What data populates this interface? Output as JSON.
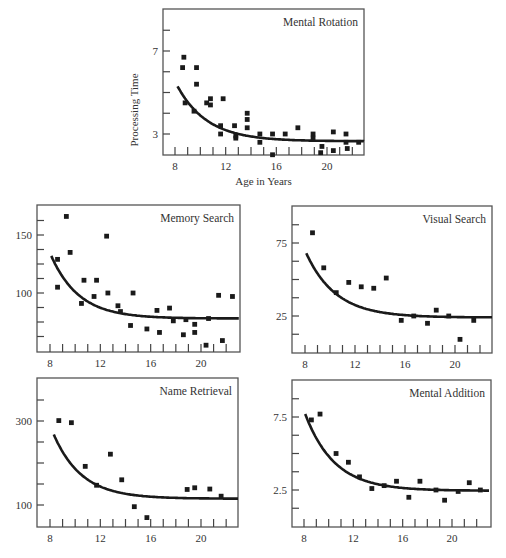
{
  "figure": {
    "x_axis_label": "Age in Years",
    "y_axis_label": "Processing Time"
  },
  "chart_data": [
    {
      "type": "scatter",
      "title": "Mental Rotation",
      "xlabel": "Age in Years",
      "ylabel": "Processing Time",
      "xlim": [
        7,
        23
      ],
      "ylim": [
        2,
        9
      ],
      "x_ticks": [
        8,
        12,
        16,
        20
      ],
      "y_ticks_labeled": [
        3,
        7
      ],
      "grid": false,
      "frame": {
        "x0": 163,
        "y0": 9,
        "x1": 364,
        "y1": 155
      },
      "axis_map": {
        "x_ref": [
          8,
          175,
          20,
          327
        ],
        "y_ref": [
          3,
          134,
          7,
          51
        ]
      },
      "points": [
        [
          8.7,
          6.7
        ],
        [
          8.6,
          6.2
        ],
        [
          9.7,
          6.2
        ],
        [
          9.7,
          5.4
        ],
        [
          8.8,
          4.5
        ],
        [
          9.5,
          4.1
        ],
        [
          10.5,
          4.5
        ],
        [
          10.8,
          4.7
        ],
        [
          10.8,
          4.4
        ],
        [
          11.8,
          4.7
        ],
        [
          11.6,
          3.4
        ],
        [
          11.6,
          3.0
        ],
        [
          12.7,
          3.4
        ],
        [
          12.8,
          2.9
        ],
        [
          12.8,
          2.8
        ],
        [
          13.7,
          4.0
        ],
        [
          13.7,
          3.7
        ],
        [
          13.7,
          3.3
        ],
        [
          14.7,
          3.0
        ],
        [
          14.7,
          2.6
        ],
        [
          15.7,
          3.0
        ],
        [
          15.7,
          2.0
        ],
        [
          16.7,
          3.0
        ],
        [
          17.7,
          3.3
        ],
        [
          18.9,
          3.0
        ],
        [
          18.9,
          2.8
        ],
        [
          19.6,
          2.4
        ],
        [
          19.5,
          2.1
        ],
        [
          20.5,
          3.1
        ],
        [
          20.5,
          2.2
        ],
        [
          21.5,
          3.0
        ],
        [
          21.5,
          2.6
        ],
        [
          21.6,
          2.3
        ],
        [
          22.5,
          2.6
        ]
      ],
      "curve": {
        "form": "exponential_decay",
        "asymptote": 2.65,
        "start": [
          8.2,
          5.3
        ],
        "k": 0.42,
        "x_range": [
          8.2,
          23
        ]
      }
    },
    {
      "type": "scatter",
      "title": "Memory Search",
      "xlabel": "",
      "ylabel": "",
      "xlim": [
        7,
        23
      ],
      "ylim": [
        50,
        175
      ],
      "x_ticks": [
        8,
        12,
        16,
        20
      ],
      "y_ticks_labeled": [
        100,
        150
      ],
      "grid": false,
      "frame": {
        "x0": 37,
        "y0": 205,
        "x1": 240,
        "y1": 352
      },
      "axis_map": {
        "x_ref": [
          8,
          50,
          20,
          201
        ],
        "y_ref": [
          100,
          293,
          150,
          235
        ]
      },
      "points": [
        [
          9.3,
          166
        ],
        [
          8.6,
          129
        ],
        [
          8.6,
          105
        ],
        [
          9.6,
          135
        ],
        [
          10.5,
          91
        ],
        [
          10.7,
          111
        ],
        [
          11.5,
          97
        ],
        [
          11.7,
          111
        ],
        [
          12.5,
          149
        ],
        [
          12.6,
          100
        ],
        [
          13.4,
          89
        ],
        [
          13.6,
          84
        ],
        [
          14.4,
          72
        ],
        [
          14.6,
          100
        ],
        [
          15.7,
          69
        ],
        [
          16.5,
          85
        ],
        [
          16.7,
          66
        ],
        [
          17.5,
          87
        ],
        [
          17.8,
          76
        ],
        [
          18.6,
          64
        ],
        [
          18.8,
          77
        ],
        [
          19.5,
          73
        ],
        [
          19.5,
          66
        ],
        [
          20.4,
          55
        ],
        [
          20.6,
          78
        ],
        [
          21.4,
          98
        ],
        [
          21.7,
          59
        ],
        [
          22.5,
          97
        ]
      ],
      "curve": {
        "form": "exponential_decay",
        "asymptote": 78,
        "start": [
          8.1,
          132
        ],
        "k": 0.45,
        "x_range": [
          8.1,
          23
        ]
      }
    },
    {
      "type": "scatter",
      "title": "Visual Search",
      "xlabel": "",
      "ylabel": "",
      "xlim": [
        7,
        23
      ],
      "ylim": [
        0,
        90
      ],
      "x_ticks": [
        8,
        12,
        16,
        20
      ],
      "y_ticks_labeled": [
        25,
        75
      ],
      "grid": false,
      "frame": {
        "x0": 292,
        "y0": 206,
        "x1": 492,
        "y1": 353
      },
      "axis_map": {
        "x_ref": [
          8,
          305,
          20,
          455
        ],
        "y_ref": [
          25,
          316,
          75,
          243
        ]
      },
      "points": [
        [
          8.6,
          82
        ],
        [
          9.5,
          58
        ],
        [
          10.5,
          41
        ],
        [
          11.5,
          48
        ],
        [
          12.5,
          45
        ],
        [
          13.5,
          44
        ],
        [
          14.5,
          51
        ],
        [
          15.7,
          22
        ],
        [
          16.7,
          25
        ],
        [
          17.8,
          20
        ],
        [
          18.5,
          29
        ],
        [
          19.5,
          25
        ],
        [
          20.4,
          9
        ],
        [
          21.5,
          22
        ]
      ],
      "curve": {
        "form": "exponential_decay",
        "asymptote": 24,
        "start": [
          8.1,
          68
        ],
        "k": 0.42,
        "x_range": [
          8.1,
          23
        ]
      }
    },
    {
      "type": "scatter",
      "title": "Name Retrieval",
      "xlabel": "",
      "ylabel": "",
      "xlim": [
        7,
        23
      ],
      "ylim": [
        50,
        400
      ],
      "x_ticks": [
        8,
        12,
        16,
        20
      ],
      "y_ticks_labeled": [
        100,
        300
      ],
      "grid": false,
      "frame": {
        "x0": 37,
        "y0": 378,
        "x1": 238,
        "y1": 527
      },
      "axis_map": {
        "x_ref": [
          8,
          50,
          20,
          201
        ],
        "y_ref": [
          100,
          505,
          300,
          421
        ]
      },
      "points": [
        [
          8.7,
          301
        ],
        [
          9.7,
          296
        ],
        [
          10.8,
          192
        ],
        [
          11.7,
          147
        ],
        [
          12.8,
          221
        ],
        [
          13.7,
          160
        ],
        [
          14.7,
          96
        ],
        [
          15.7,
          70
        ],
        [
          18.9,
          137
        ],
        [
          19.5,
          141
        ],
        [
          20.7,
          138
        ],
        [
          21.6,
          121
        ]
      ],
      "curve": {
        "form": "exponential_decay",
        "asymptote": 115,
        "start": [
          8.3,
          268
        ],
        "k": 0.45,
        "x_range": [
          8.3,
          23
        ]
      }
    },
    {
      "type": "scatter",
      "title": "Mental Addition",
      "xlabel": "",
      "ylabel": "",
      "xlim": [
        7,
        23
      ],
      "ylim": [
        0,
        10
      ],
      "x_ticks": [
        8,
        12,
        16,
        20
      ],
      "y_ticks_labeled": [
        2.5,
        7.5
      ],
      "grid": false,
      "frame": {
        "x0": 292,
        "y0": 380,
        "x1": 491,
        "y1": 527
      },
      "axis_map": {
        "x_ref": [
          8,
          304,
          20,
          452
        ],
        "y_ref": [
          2.5,
          490,
          7.5,
          417
        ]
      },
      "points": [
        [
          8.6,
          7.3
        ],
        [
          9.3,
          7.7
        ],
        [
          10.6,
          5.0
        ],
        [
          11.6,
          4.4
        ],
        [
          12.5,
          3.4
        ],
        [
          13.5,
          2.6
        ],
        [
          14.5,
          2.8
        ],
        [
          15.5,
          3.1
        ],
        [
          16.5,
          2.0
        ],
        [
          17.4,
          3.1
        ],
        [
          18.7,
          2.5
        ],
        [
          19.4,
          1.8
        ],
        [
          20.5,
          2.4
        ],
        [
          21.4,
          3.0
        ],
        [
          22.3,
          2.5
        ]
      ],
      "curve": {
        "form": "exponential_decay",
        "asymptote": 2.45,
        "start": [
          8.1,
          7.7
        ],
        "k": 0.42,
        "x_range": [
          8.1,
          23
        ]
      }
    }
  ]
}
